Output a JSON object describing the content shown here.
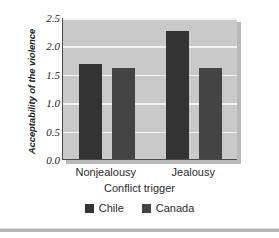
{
  "chart_data": {
    "type": "bar",
    "title": "",
    "xlabel": "Conflict trigger",
    "ylabel": "Acceptability of the violence",
    "categories": [
      "Nonjealousy",
      "Jealousy"
    ],
    "series": [
      {
        "name": "Chile",
        "values": [
          1.68,
          2.25
        ],
        "color": "#333333"
      },
      {
        "name": "Canada",
        "values": [
          1.61,
          1.61
        ],
        "color": "#444444"
      }
    ],
    "ylim": [
      0.0,
      2.5
    ],
    "ytick_labels": [
      "0.0",
      "0.5",
      "1.0",
      "1.5",
      "2.0",
      "2.5"
    ],
    "ytick_values": [
      0.0,
      0.5,
      1.0,
      1.5,
      2.0,
      2.5
    ],
    "grid": true,
    "grid_color": "#f2f2f2",
    "plot_background": "#c9c9c9",
    "axis_color": "#4c4c4c",
    "legend_position": "bottom-center",
    "legend_entries": [
      "Chile",
      "Canada"
    ]
  }
}
